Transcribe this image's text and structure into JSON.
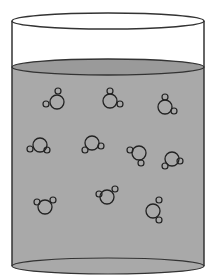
{
  "diagram": {
    "type": "beaker-with-molecules",
    "colors": {
      "background": "#ffffff",
      "outline": "#333333",
      "liquid": "#a9a9a9",
      "liquid_surface": "#9a9a9a",
      "molecule_stroke": "#222222"
    },
    "beaker": {
      "left_x": 12,
      "right_x": 204,
      "top_y": 21,
      "surface_y": 67,
      "bottom_y": 266,
      "ellipse_ry": 8
    },
    "molecules": [
      {
        "center": [
          57,
          102
        ],
        "atoms": [
          [
            58,
            91
          ],
          [
            46,
            104
          ]
        ]
      },
      {
        "center": [
          110,
          101
        ],
        "atoms": [
          [
            110,
            91
          ],
          [
            120,
            104
          ]
        ]
      },
      {
        "center": [
          165,
          107
        ],
        "atoms": [
          [
            165,
            97
          ],
          [
            174,
            111
          ]
        ]
      },
      {
        "center": [
          40,
          145
        ],
        "atoms": [
          [
            30,
            149
          ],
          [
            47,
            150
          ]
        ]
      },
      {
        "center": [
          92,
          143
        ],
        "atoms": [
          [
            85,
            150
          ],
          [
            101,
            146
          ]
        ]
      },
      {
        "center": [
          139,
          153
        ],
        "atoms": [
          [
            130,
            150
          ],
          [
            141,
            163
          ]
        ]
      },
      {
        "center": [
          172,
          159
        ],
        "atoms": [
          [
            165,
            166
          ],
          [
            180,
            161
          ]
        ]
      },
      {
        "center": [
          45,
          207
        ],
        "atoms": [
          [
            37,
            202
          ],
          [
            53,
            200
          ]
        ]
      },
      {
        "center": [
          107,
          197
        ],
        "atoms": [
          [
            99,
            194
          ],
          [
            115,
            189
          ]
        ]
      },
      {
        "center": [
          153,
          211
        ],
        "atoms": [
          [
            159,
            200
          ],
          [
            159,
            220
          ]
        ]
      }
    ],
    "molecule_radius": 7,
    "atom_radius": 3
  }
}
